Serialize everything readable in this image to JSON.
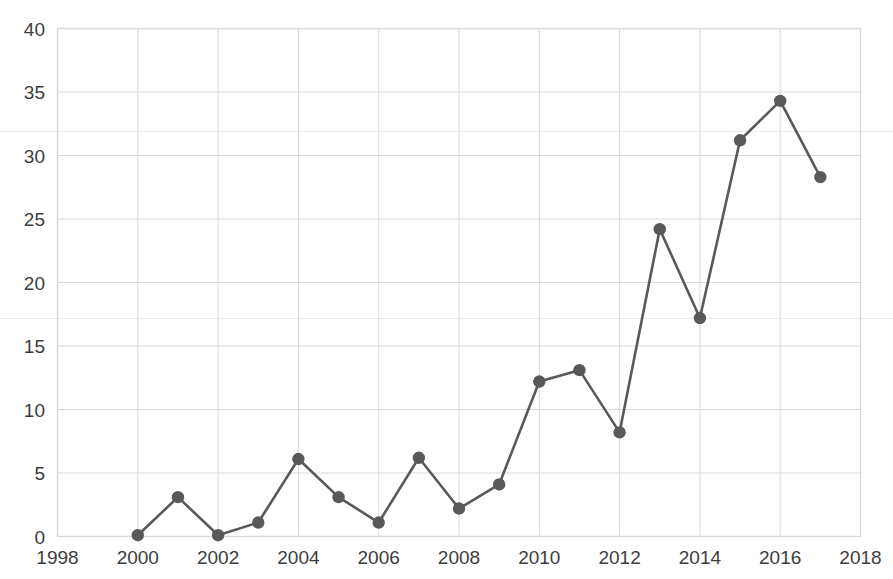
{
  "chart_data": {
    "type": "line",
    "title": "",
    "subtitle": "",
    "xlabel": "",
    "ylabel": "",
    "x": [
      2000,
      2001,
      2002,
      2003,
      2004,
      2005,
      2006,
      2007,
      2008,
      2009,
      2010,
      2011,
      2012,
      2013,
      2014,
      2015,
      2016,
      2017
    ],
    "values": [
      0.1,
      3.1,
      0.1,
      1.1,
      6.1,
      3.1,
      1.1,
      6.2,
      2.2,
      4.1,
      12.2,
      13.1,
      8.2,
      24.2,
      17.2,
      31.2,
      34.3,
      28.3
    ],
    "series": [
      {
        "name": "series-1",
        "values": [
          0.1,
          3.1,
          0.1,
          1.1,
          6.1,
          3.1,
          1.1,
          6.2,
          2.2,
          4.1,
          12.2,
          13.1,
          8.2,
          24.2,
          17.2,
          31.2,
          34.3,
          28.3
        ]
      }
    ],
    "xlim": [
      1998,
      2018
    ],
    "ylim": [
      0,
      40
    ],
    "ytick_labels": [
      "0",
      "5",
      "10",
      "15",
      "20",
      "25",
      "30",
      "35",
      "40"
    ],
    "ytick_values": [
      0,
      5,
      10,
      15,
      20,
      25,
      30,
      35,
      40
    ],
    "xtick_labels": [
      "1998",
      "2000",
      "2002",
      "2004",
      "2006",
      "2008",
      "2010",
      "2012",
      "2014",
      "2016",
      "2018"
    ],
    "xtick_values": [
      1998,
      2000,
      2002,
      2004,
      2006,
      2008,
      2010,
      2012,
      2014,
      2016,
      2018
    ],
    "grid": {
      "horizontal": true,
      "vertical": true,
      "color": "#d9d9d9"
    },
    "legend": {
      "visible": false,
      "position": "none",
      "entries": []
    },
    "style": {
      "line_color": "#595959",
      "marker_color": "#595959",
      "marker_shape": "circle",
      "background": "#ffffff",
      "axis_text_color": "#3d3d3d"
    }
  }
}
